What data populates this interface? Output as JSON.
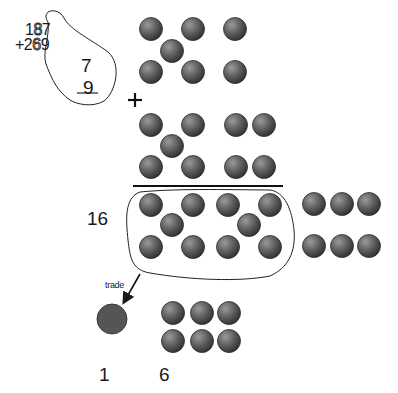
{
  "problem": {
    "top_addend": "187",
    "bottom_addend": "+269",
    "ones_digit_top": "7",
    "ones_digit_bottom": "9"
  },
  "operators": {
    "plus": "+"
  },
  "labels": {
    "sum_of_ones": "16",
    "trade": "trade",
    "tens_result": "1",
    "ones_result": "6"
  },
  "counters": {
    "group_7": [
      [
        151,
        29
      ],
      [
        193,
        29
      ],
      [
        235,
        29
      ],
      [
        172,
        51
      ],
      [
        151,
        72
      ],
      [
        193,
        72
      ],
      [
        235,
        72
      ]
    ],
    "group_9": [
      [
        151,
        125
      ],
      [
        193,
        125
      ],
      [
        236,
        125
      ],
      [
        264,
        125
      ],
      [
        172,
        146
      ],
      [
        151,
        167
      ],
      [
        193,
        167
      ],
      [
        236,
        167
      ],
      [
        264,
        167
      ]
    ],
    "group_16_circled": [
      [
        151,
        205
      ],
      [
        193,
        205
      ],
      [
        228,
        205
      ],
      [
        270,
        205
      ],
      [
        172,
        225
      ],
      [
        249,
        225
      ],
      [
        151,
        247
      ],
      [
        193,
        247
      ],
      [
        228,
        247
      ],
      [
        270,
        247
      ]
    ],
    "group_16_outside": [
      [
        314,
        204
      ],
      [
        342,
        204
      ],
      [
        369,
        204
      ],
      [
        314,
        246
      ],
      [
        342,
        246
      ],
      [
        369,
        246
      ]
    ],
    "ones_remaining": [
      [
        173,
        313
      ],
      [
        202,
        313
      ],
      [
        229,
        313
      ],
      [
        173,
        341
      ],
      [
        202,
        341
      ],
      [
        229,
        341
      ]
    ],
    "traded_ten": [
      112,
      319
    ]
  },
  "colors": {
    "counter_light": "#9a9a9a",
    "counter_dark": "#3c3c3c",
    "traded_ten": "#555555",
    "ink": "#1a1a1a"
  }
}
